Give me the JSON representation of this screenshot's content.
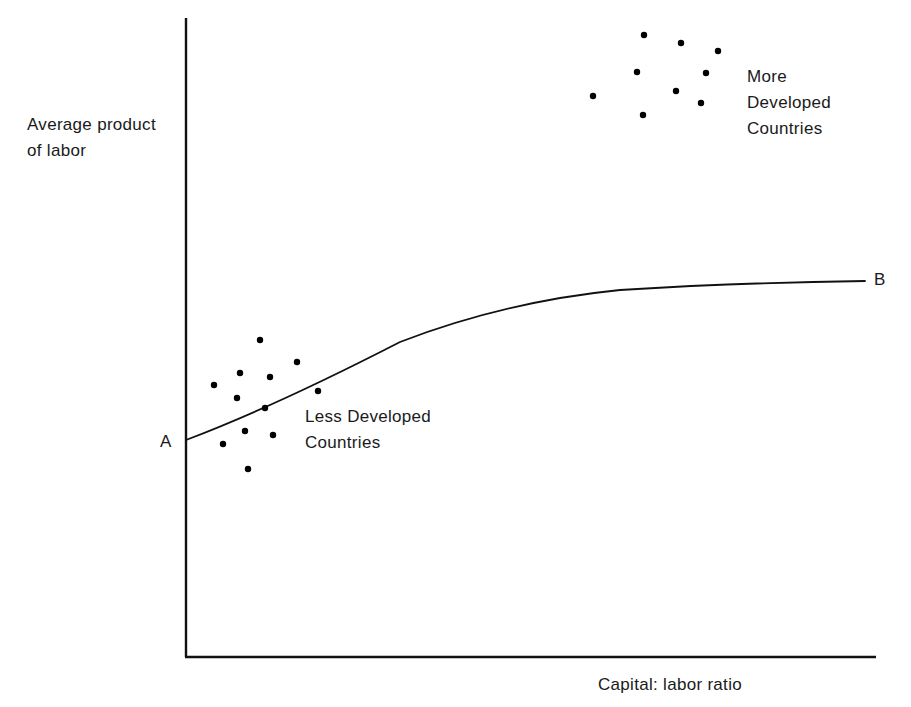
{
  "figure": {
    "page_header_fragment": "50. Brush",
    "axes": {
      "y_label": "Average product\nof labor",
      "x_label": "Capital: labor ratio",
      "y_axis_x": 186,
      "y_axis_top": 18,
      "y_axis_bottom": 657,
      "x_axis_y": 657,
      "x_axis_left": 186,
      "x_axis_right": 876
    },
    "curve": {
      "start_label": "A",
      "end_label": "B",
      "start_point": [
        186,
        440
      ],
      "end_point": [
        865,
        281
      ],
      "path": "M186,440 C 260,412 330,378 400,342 C 470,315 540,298 620,290 C 700,285 790,282 865,281"
    },
    "annotations": {
      "more_developed": "More\nDeveloped\nCountries",
      "less_developed": "Less Developed\nCountries"
    },
    "colors": {
      "ink": "#111111",
      "background": "#ffffff",
      "point": "#000000"
    }
  },
  "chart_data": {
    "type": "scatter",
    "title": "",
    "xlabel": "Capital: labor ratio",
    "ylabel": "Average product of labor",
    "grid": false,
    "legend": "inline-annotation",
    "axis_ticks": [],
    "xlim": [
      0,
      1
    ],
    "ylim": [
      0,
      1
    ],
    "series": [
      {
        "name": "Less Developed Countries",
        "label_position": [
          305,
          404
        ],
        "points": [
          [
            260,
            340
          ],
          [
            240,
            373
          ],
          [
            214,
            385
          ],
          [
            270,
            377
          ],
          [
            297,
            362
          ],
          [
            237,
            398
          ],
          [
            265,
            408
          ],
          [
            318,
            391
          ],
          [
            245,
            431
          ],
          [
            223,
            444
          ],
          [
            273,
            435
          ],
          [
            248,
            469
          ]
        ]
      },
      {
        "name": "More Developed Countries",
        "label_position": [
          747,
          64
        ],
        "points": [
          [
            644,
            35
          ],
          [
            681,
            43
          ],
          [
            718,
            51
          ],
          [
            637,
            72
          ],
          [
            706,
            73
          ],
          [
            593,
            96
          ],
          [
            676,
            91
          ],
          [
            701,
            103
          ],
          [
            643,
            115
          ]
        ]
      }
    ],
    "curve": {
      "name": "Production function A-B",
      "start": "A",
      "end": "B",
      "description": "Concave increasing curve from point A on the vertical axis to point B at the right"
    }
  }
}
